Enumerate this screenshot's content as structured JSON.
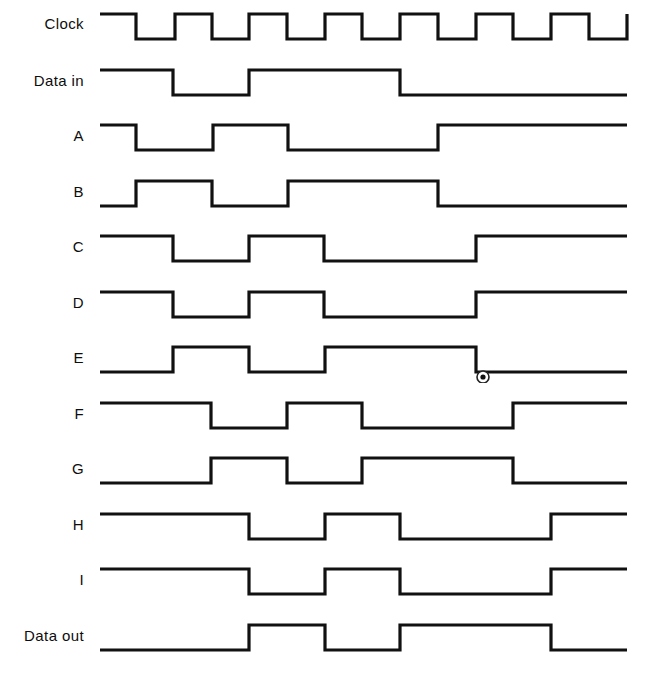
{
  "figure": {
    "kind": "digital-timing-diagram",
    "background_color": "#ffffff",
    "line_color": "#111111",
    "label_color": "#0d0d0d",
    "width": 649,
    "height": 684,
    "time_axis": {
      "x_start": 100,
      "x_end": 627,
      "clock_period_px": 75
    }
  },
  "chart_data": {
    "type": "line",
    "title": "",
    "xlabel": "",
    "ylabel": "",
    "subtype": "timing-waveform",
    "x_start": 100,
    "x_end": 627,
    "high_offset": 0,
    "low_offset": 25,
    "signals": [
      {
        "name": "Clock",
        "label": "Clock",
        "row_top": 10,
        "label_y": 24,
        "initial_level": "high",
        "transitions": [
          136,
          175,
          212,
          249,
          287,
          325,
          362,
          400,
          438,
          476,
          513,
          551,
          589,
          627
        ],
        "description": "Free-running square wave, 50% duty, period 75 px"
      },
      {
        "name": "Data in",
        "label": "Data in",
        "row_top": 66,
        "label_y": 81,
        "initial_level": "high",
        "transitions": [
          173,
          249,
          400
        ],
        "description": "High, low for one clock, high for two clocks, then low"
      },
      {
        "name": "A",
        "label": "A",
        "row_top": 121,
        "label_y": 136,
        "initial_level": "high",
        "transitions": [
          136,
          213,
          288,
          438
        ],
        "description": "Shift register stage A"
      },
      {
        "name": "B",
        "label": "B",
        "row_top": 177,
        "label_y": 192,
        "initial_level": "low",
        "transitions": [
          136,
          212,
          288,
          438
        ],
        "description": "Complement of A"
      },
      {
        "name": "C",
        "label": "C",
        "row_top": 232,
        "label_y": 247,
        "initial_level": "high",
        "transitions": [
          173,
          249,
          324,
          476
        ],
        "description": "Shift register stage C"
      },
      {
        "name": "D",
        "label": "D",
        "row_top": 288,
        "label_y": 303,
        "initial_level": "high",
        "transitions": [
          173,
          249,
          324,
          476
        ],
        "description": "Shift register stage D"
      },
      {
        "name": "E",
        "label": "E",
        "row_top": 343,
        "label_y": 358,
        "initial_level": "low",
        "transitions": [
          173,
          249,
          325,
          476
        ],
        "description": "Complement of D; probe point marked",
        "marker": {
          "x": 483,
          "y": 377,
          "type": "probe-point",
          "outer_radius": 6,
          "inner_radius": 2.6
        }
      },
      {
        "name": "F",
        "label": "F",
        "row_top": 399,
        "label_y": 414,
        "initial_level": "high",
        "transitions": [
          211,
          287,
          362,
          513
        ],
        "description": "Shift register stage F"
      },
      {
        "name": "G",
        "label": "G",
        "row_top": 454,
        "label_y": 469,
        "initial_level": "low",
        "transitions": [
          211,
          287,
          362,
          513
        ],
        "description": "Complement of F"
      },
      {
        "name": "H",
        "label": "H",
        "row_top": 510,
        "label_y": 525,
        "initial_level": "high",
        "transitions": [
          249,
          325,
          400,
          551
        ],
        "description": "Shift register stage H"
      },
      {
        "name": "I",
        "label": "I",
        "row_top": 565,
        "label_y": 580,
        "initial_level": "high",
        "transitions": [
          249,
          325,
          400,
          551
        ],
        "description": "Shift register stage I"
      },
      {
        "name": "Data out",
        "label": "Data out",
        "row_top": 621,
        "label_y": 636,
        "initial_level": "low",
        "transitions": [
          249,
          325,
          400,
          551
        ],
        "description": "Delayed copy of Data in"
      }
    ]
  }
}
